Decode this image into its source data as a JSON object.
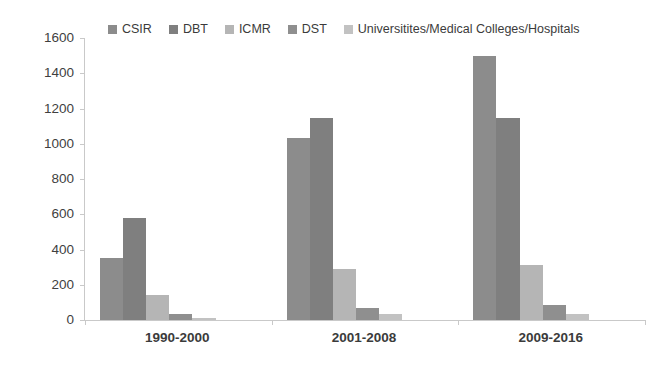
{
  "chart_data": {
    "type": "bar",
    "title": "",
    "subtitle": "",
    "xlabel": "",
    "ylabel": "",
    "categories": [
      "1990-2000",
      "2001-2008",
      "2009-2016"
    ],
    "series": [
      {
        "name": "CSIR",
        "color": "#8c8c8c",
        "values": [
          350,
          1030,
          1500
        ]
      },
      {
        "name": "DBT",
        "color": "#7f7f7f",
        "values": [
          580,
          1145,
          1145
        ]
      },
      {
        "name": "ICMR",
        "color": "#b5b5b5",
        "values": [
          140,
          290,
          310
        ]
      },
      {
        "name": "DST",
        "color": "#8f8f8f",
        "values": [
          35,
          70,
          85
        ]
      },
      {
        "name": "Universitites/Medical Colleges/Hospitals",
        "color": "#c2c2c2",
        "values": [
          10,
          35,
          35
        ]
      }
    ],
    "ylim": [
      0,
      1600
    ],
    "ytick_values": [
      1600,
      1400,
      1200,
      1000,
      800,
      600,
      400,
      200,
      0
    ],
    "ytick_labels": [
      "1600",
      "1400",
      "1200",
      "1000",
      "800",
      "600",
      "400",
      "200",
      "0"
    ],
    "grid": false,
    "legend_position": "top",
    "axis_color": "#c9c9c9",
    "text_color": "#3b3b3b",
    "background": "#ffffff"
  },
  "legend": {
    "items": [
      {
        "label": "CSIR",
        "swatch_name": "legend-swatch-csir"
      },
      {
        "label": "DBT",
        "swatch_name": "legend-swatch-dbt"
      },
      {
        "label": "ICMR",
        "swatch_name": "legend-swatch-icmr"
      },
      {
        "label": "DST",
        "swatch_name": "legend-swatch-dst"
      },
      {
        "label": "Universitites/Medical Colleges/Hospitals",
        "swatch_name": "legend-swatch-universities"
      }
    ]
  }
}
